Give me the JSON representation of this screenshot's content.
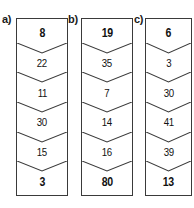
{
  "diagram": {
    "type": "chevron-stack-columns",
    "columns": [
      {
        "label": "a)",
        "cells": [
          {
            "value": "8",
            "emphasis": true
          },
          {
            "value": "22",
            "emphasis": false
          },
          {
            "value": "11",
            "emphasis": false
          },
          {
            "value": "30",
            "emphasis": false
          },
          {
            "value": "15",
            "emphasis": false
          },
          {
            "value": "3",
            "emphasis": true
          }
        ]
      },
      {
        "label": "b)",
        "cells": [
          {
            "value": "19",
            "emphasis": true
          },
          {
            "value": "35",
            "emphasis": false
          },
          {
            "value": "7",
            "emphasis": false
          },
          {
            "value": "14",
            "emphasis": false
          },
          {
            "value": "16",
            "emphasis": false
          },
          {
            "value": "80",
            "emphasis": true
          }
        ]
      },
      {
        "label": "c)",
        "cells": [
          {
            "value": "6",
            "emphasis": true
          },
          {
            "value": "3",
            "emphasis": false
          },
          {
            "value": "30",
            "emphasis": false
          },
          {
            "value": "41",
            "emphasis": false
          },
          {
            "value": "39",
            "emphasis": false
          },
          {
            "value": "13",
            "emphasis": true
          }
        ]
      }
    ],
    "colors": {
      "border": "#3a3a3a",
      "text": "#111111",
      "background": "#ffffff"
    }
  }
}
